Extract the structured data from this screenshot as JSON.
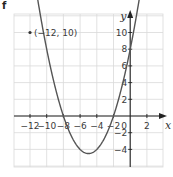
{
  "part_label": "f",
  "chart_data": {
    "type": "line",
    "title": "",
    "xlabel": "x",
    "ylabel": "y",
    "xlim": [
      -13.8,
      4
    ],
    "ylim": [
      -6,
      12
    ],
    "grid": true,
    "x_ticks": [
      -12,
      -10,
      -8,
      -6,
      -4,
      -2,
      0,
      2
    ],
    "x_tick_labels": [
      "−12",
      "−10",
      "−8",
      "−6",
      "−4",
      "−2",
      "0",
      "2"
    ],
    "y_ticks": [
      10,
      8,
      6,
      4,
      2,
      -2,
      -4
    ],
    "y_tick_labels": [
      "10",
      "8",
      "6",
      "4",
      "2",
      "−2",
      "−4"
    ],
    "series": [
      {
        "name": "parabola",
        "equation": "y = 0.5(x+8)(x+2)",
        "roots": [
          -8,
          -2
        ],
        "vertex": [
          -5,
          -4.5
        ],
        "y_intercept": 4,
        "color": "#555555"
      }
    ],
    "annotations": [
      {
        "point": [
          -12,
          10
        ],
        "label": "(−12, 10)"
      }
    ]
  },
  "colors": {
    "grid": "#d9d9d9",
    "axis": "#222222",
    "curve": "#555555"
  }
}
